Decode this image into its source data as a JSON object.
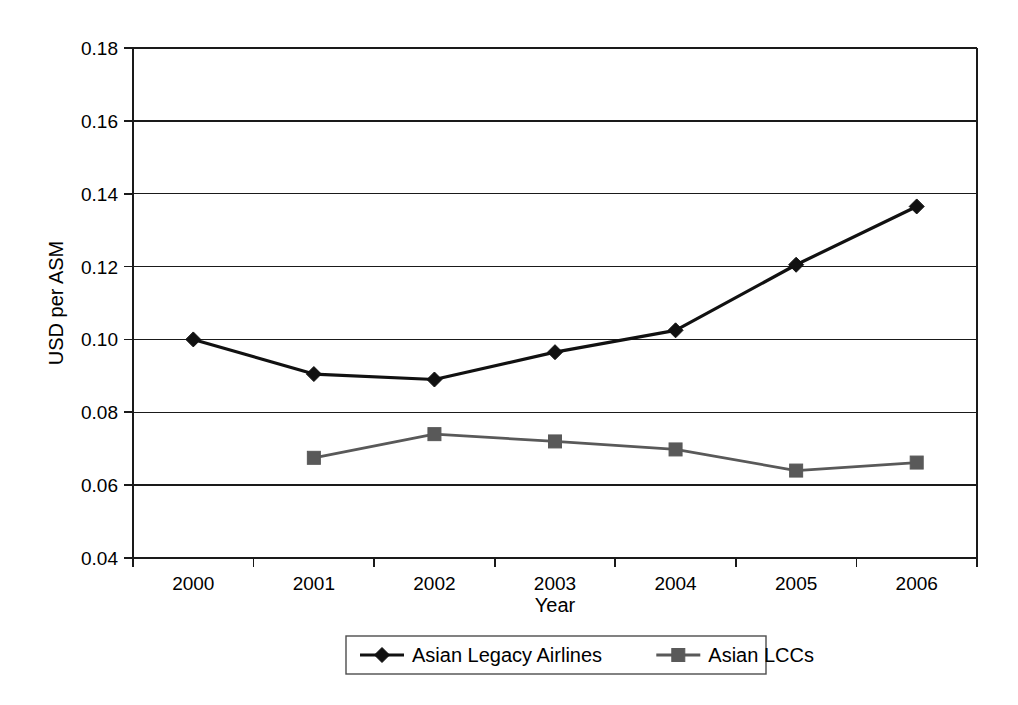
{
  "chart_data": {
    "type": "line",
    "title": "",
    "xlabel": "Year",
    "ylabel": "USD per ASM",
    "categories": [
      "2000",
      "2001",
      "2002",
      "2003",
      "2004",
      "2005",
      "2006"
    ],
    "x": [
      2000,
      2001,
      2002,
      2003,
      2004,
      2005,
      2006
    ],
    "ylim": [
      0.04,
      0.18
    ],
    "yticks": [
      "0.04",
      "0.06",
      "0.08",
      "0.10",
      "0.12",
      "0.14",
      "0.16",
      "0.18"
    ],
    "ytick_values": [
      0.04,
      0.06,
      0.08,
      0.1,
      0.12,
      0.14,
      0.16,
      0.18
    ],
    "grid": "horizontal",
    "legend_position": "bottom",
    "series": [
      {
        "name": "Asian Legacy Airlines",
        "marker": "diamond",
        "color": "#111111",
        "values": [
          0.1,
          0.0905,
          0.089,
          0.0965,
          0.1025,
          0.1205,
          0.1365
        ]
      },
      {
        "name": "Asian LCCs",
        "marker": "square",
        "color": "#595959",
        "values": [
          null,
          0.0675,
          0.074,
          0.072,
          0.0698,
          0.064,
          0.0662
        ]
      }
    ]
  },
  "legend": {
    "items": [
      {
        "label": "Asian Legacy Airlines",
        "marker": "diamond-marker",
        "color": "#111111"
      },
      {
        "label": "Asian LCCs",
        "marker": "square-marker",
        "color": "#595959"
      }
    ]
  },
  "axes": {
    "y_title": "USD per ASM",
    "x_title": "Year"
  }
}
